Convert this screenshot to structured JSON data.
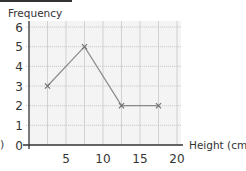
{
  "chart_data": {
    "type": "line",
    "title": "",
    "xlabel": "Height (cm)",
    "ylabel": "Frequency",
    "x": [
      2.5,
      7.5,
      12.5,
      17.5
    ],
    "values": [
      3,
      5,
      2,
      2
    ],
    "series": [
      {
        "name": "Frequency polygon",
        "x": [
          2.5,
          7.5,
          12.5,
          17.5
        ],
        "values": [
          3,
          5,
          2,
          2
        ]
      }
    ],
    "xlim": [
      0,
      20
    ],
    "ylim": [
      0,
      6
    ],
    "x_ticks": [
      5,
      10,
      15,
      20
    ],
    "y_ticks": [
      0,
      1,
      2,
      3,
      4,
      5,
      6
    ],
    "grid": true,
    "marker": "x",
    "legend": null
  },
  "labels": {
    "ylabel": "Frequency",
    "xlabel": "Height (cm)",
    "clipped_left_char": ")"
  },
  "colors": {
    "line": "#8a8a8a",
    "grid": "#c8c8c8",
    "axis": "#333333",
    "background": "#f4f4f4"
  }
}
